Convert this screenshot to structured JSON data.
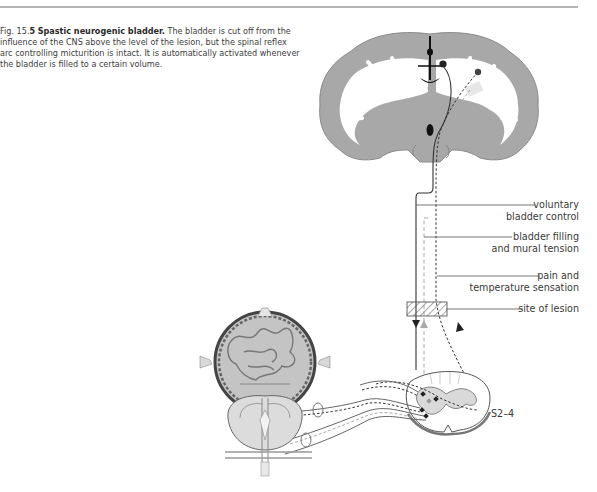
{
  "figure": {
    "number_prefix": "Fig. 15.",
    "number_suffix": "5",
    "title": "Spastic neurogenic bladder.",
    "caption": "The bladder is cut off from the influence of the CNS above the level of the lesion, but the spinal reflex arc controlling micturition is intact. It is automatically activated whenever the bladder is filled to a certain volume."
  },
  "labels": {
    "voluntary_line1": "voluntary",
    "voluntary_line2": "bladder control",
    "filling_line1": "bladder filling",
    "filling_line2": "and mural tension",
    "pain_line1": "pain and",
    "pain_line2": "temperature sensation",
    "lesion": "site of lesion",
    "segment": "S2–4"
  },
  "colors": {
    "cortex": "#a8a8a8",
    "line": "#333333",
    "gray_path": "#9a9a9a",
    "rule": "#b5b5b5"
  }
}
